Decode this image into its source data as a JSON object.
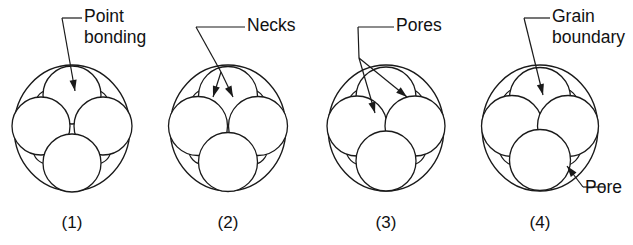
{
  "figure": {
    "background_color": "#ffffff",
    "line_color": "#1a1a1a",
    "text_color": "#111111",
    "width": 633,
    "height": 245
  },
  "panels": [
    {
      "id": "panel-1",
      "number": "(1)",
      "stage_name": "Point bonding",
      "center_x": 72,
      "center_y": 128,
      "outer_radius": 63,
      "grain_radius": 29,
      "grain_offset": 31,
      "labels": [
        {
          "name": "point-bonding",
          "lines": [
            "Point",
            "bonding"
          ],
          "text_x": 84,
          "text_y": 22,
          "elbow": [
            [
              62,
              18
            ],
            [
              82,
              18
            ]
          ],
          "arrow_from": [
            62,
            18
          ],
          "arrow_to": [
            75,
            91
          ]
        }
      ]
    },
    {
      "id": "panel-2",
      "number": "(2)",
      "stage_name": "Necks",
      "center_x": 228,
      "center_y": 128,
      "outer_radius": 63,
      "grain_radius": 29.5,
      "grain_offset": 30,
      "labels": [
        {
          "name": "necks",
          "lines": [
            "Necks"
          ],
          "text_x": 247,
          "text_y": 31,
          "elbow": [
            [
              196,
              27
            ],
            [
              245,
              27
            ]
          ],
          "arrow_from": [
            196,
            27
          ],
          "arrow_to": [
            213,
            97
          ],
          "arrow_to_2": [
            233,
            97
          ],
          "branch_point": [
            221,
            72
          ]
        }
      ]
    },
    {
      "id": "panel-3",
      "number": "(3)",
      "stage_name": "Pores",
      "center_x": 386,
      "center_y": 128,
      "outer_radius": 63,
      "grain_radius": 30,
      "grain_offset": 29,
      "labels": [
        {
          "name": "pores",
          "lines": [
            "Pores"
          ],
          "text_x": 396,
          "text_y": 31,
          "elbow": [
            [
              358,
              27
            ],
            [
              394,
              27
            ]
          ],
          "arrow_from": [
            358,
            27
          ],
          "arrow_to": [
            375,
            113
          ],
          "arrow_to_2": [
            407,
            97
          ],
          "branch_point": [
            359,
            58
          ]
        }
      ]
    },
    {
      "id": "panel-4",
      "number": "(4)",
      "stage_name": "Grain boundary",
      "center_x": 540,
      "center_y": 128,
      "outer_radius": 63,
      "grain_radius": 30.5,
      "grain_offset": 28,
      "labels": [
        {
          "name": "grain-boundary",
          "lines": [
            "Grain",
            "boundary"
          ],
          "text_x": 552,
          "text_y": 22,
          "elbow": [
            [
              524,
              18
            ],
            [
              550,
              18
            ]
          ],
          "arrow_from": [
            524,
            18
          ],
          "arrow_to": [
            543,
            95
          ]
        },
        {
          "name": "pore",
          "lines": [
            "Pore"
          ],
          "text_x": 585,
          "text_y": 193,
          "elbow": [
            [
              583,
              187
            ],
            [
              605,
              187
            ]
          ],
          "arrow_from": [
            583,
            187
          ],
          "arrow_to": [
            567,
            166
          ]
        }
      ]
    }
  ]
}
